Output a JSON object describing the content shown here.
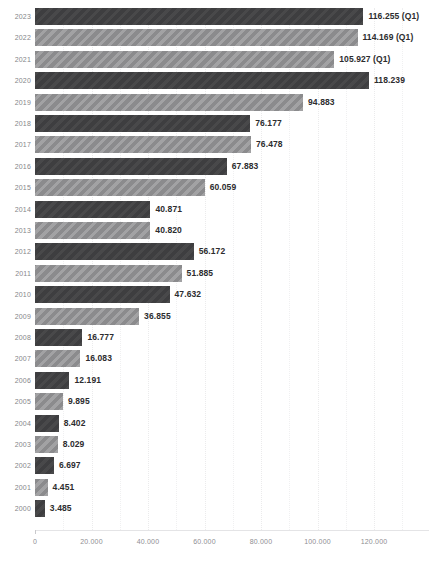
{
  "chart_data": {
    "type": "bar",
    "orientation": "horizontal",
    "title": "",
    "subtitle": "",
    "xlabel": "",
    "ylabel": "",
    "xlim": [
      0,
      130000
    ],
    "grid": true,
    "legend": false,
    "x_tick_labels": [
      "0",
      "20.000",
      "40.000",
      "60.000",
      "80.000",
      "100.000",
      "120.000"
    ],
    "x_tick_values": [
      0,
      20000,
      40000,
      60000,
      80000,
      100000,
      120000
    ],
    "minor_gridline_values": [
      10000,
      30000,
      50000,
      70000,
      90000,
      110000,
      130000
    ],
    "categories": [
      "2023",
      "2022",
      "2021",
      "2020",
      "2019",
      "2018",
      "2017",
      "2016",
      "2015",
      "2014",
      "2013",
      "2012",
      "2011",
      "2010",
      "2009",
      "2008",
      "2007",
      "2006",
      "2005",
      "2004",
      "2003",
      "2002",
      "2001",
      "2000"
    ],
    "values": [
      116255,
      114169,
      105927,
      118239,
      94883,
      76177,
      76478,
      67883,
      60059,
      40871,
      40820,
      56172,
      51885,
      47632,
      36855,
      16777,
      16083,
      12191,
      9895,
      8402,
      8029,
      6697,
      4451,
      3485
    ],
    "bars": [
      {
        "category": "2023",
        "value": 116255,
        "label": "116.255 (Q1)",
        "style": "dark"
      },
      {
        "category": "2022",
        "value": 114169,
        "label": "114.169 (Q1)",
        "style": "light"
      },
      {
        "category": "2021",
        "value": 105927,
        "label": "105.927 (Q1)",
        "style": "light"
      },
      {
        "category": "2020",
        "value": 118239,
        "label": "118.239",
        "style": "dark"
      },
      {
        "category": "2019",
        "value": 94883,
        "label": "94.883",
        "style": "light"
      },
      {
        "category": "2018",
        "value": 76177,
        "label": "76.177",
        "style": "dark"
      },
      {
        "category": "2017",
        "value": 76478,
        "label": "76.478",
        "style": "light"
      },
      {
        "category": "2016",
        "value": 67883,
        "label": "67.883",
        "style": "dark"
      },
      {
        "category": "2015",
        "value": 60059,
        "label": "60.059",
        "style": "light"
      },
      {
        "category": "2014",
        "value": 40871,
        "label": "40.871",
        "style": "dark"
      },
      {
        "category": "2013",
        "value": 40820,
        "label": "40.820",
        "style": "light"
      },
      {
        "category": "2012",
        "value": 56172,
        "label": "56.172",
        "style": "dark"
      },
      {
        "category": "2011",
        "value": 51885,
        "label": "51.885",
        "style": "light"
      },
      {
        "category": "2010",
        "value": 47632,
        "label": "47.632",
        "style": "dark"
      },
      {
        "category": "2009",
        "value": 36855,
        "label": "36.855",
        "style": "light"
      },
      {
        "category": "2008",
        "value": 16777,
        "label": "16.777",
        "style": "dark"
      },
      {
        "category": "2007",
        "value": 16083,
        "label": "16.083",
        "style": "light"
      },
      {
        "category": "2006",
        "value": 12191,
        "label": "12.191",
        "style": "dark"
      },
      {
        "category": "2005",
        "value": 9895,
        "label": "9.895",
        "style": "light"
      },
      {
        "category": "2004",
        "value": 8402,
        "label": "8.402",
        "style": "dark"
      },
      {
        "category": "2003",
        "value": 8029,
        "label": "8.029",
        "style": "light"
      },
      {
        "category": "2002",
        "value": 6697,
        "label": "6.697",
        "style": "dark"
      },
      {
        "category": "2001",
        "value": 4451,
        "label": "4.451",
        "style": "light"
      },
      {
        "category": "2000",
        "value": 3485,
        "label": "3.485",
        "style": "dark"
      }
    ]
  },
  "colors": {
    "bar_dark": "#3e3e40",
    "bar_light": "#8b8b8d",
    "background": "#ffffff",
    "value_label": "#2c2c2e",
    "axis_label": "#8e8e92",
    "category_label": "#86868a",
    "gridline": "#f0f0f1"
  }
}
